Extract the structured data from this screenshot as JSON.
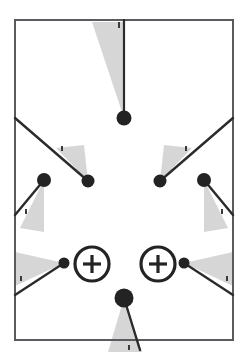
{
  "diagram": {
    "canvas": {
      "width": 248,
      "height": 355,
      "background": "#ffffff"
    },
    "colors": {
      "frame_stroke": "#5a5a5f",
      "line_stroke": "#2b2b2b",
      "node_fill": "#232323",
      "wedge_fill": "#d6d6d6",
      "tick_fill": "#3a3a3a",
      "symbol_stroke": "#232323",
      "symbol_fill": "#ffffff"
    },
    "frame": {
      "label": "border-rectangle",
      "x": 15,
      "y": 20,
      "width": 218,
      "height": 320,
      "stroke_width": 2
    },
    "nodes": [
      {
        "name": "node-top-center",
        "cx": 124,
        "cy": 118,
        "r": 7.5
      },
      {
        "name": "node-upper-left",
        "cx": 88,
        "cy": 181,
        "r": 6.5
      },
      {
        "name": "node-upper-right",
        "cx": 160,
        "cy": 181,
        "r": 6.5
      },
      {
        "name": "node-mid-left",
        "cx": 44,
        "cy": 180,
        "r": 7.0
      },
      {
        "name": "node-mid-right",
        "cx": 204,
        "cy": 180,
        "r": 7.0
      },
      {
        "name": "node-target-left",
        "cx": 64,
        "cy": 263,
        "r": 5.5
      },
      {
        "name": "node-target-right",
        "cx": 184,
        "cy": 263,
        "r": 5.5
      },
      {
        "name": "node-bottom-center",
        "cx": 124,
        "cy": 298,
        "r": 9.5
      }
    ],
    "leader_lines": [
      {
        "name": "leader-top-center",
        "x1": 124,
        "y1": 20,
        "x2": 124,
        "y2": 118,
        "width": 2.2
      },
      {
        "name": "leader-upper-left",
        "x1": 15,
        "y1": 118,
        "x2": 88,
        "y2": 181,
        "width": 2.4
      },
      {
        "name": "leader-upper-right",
        "x1": 233,
        "y1": 118,
        "x2": 160,
        "y2": 181,
        "width": 2.4
      },
      {
        "name": "leader-mid-left",
        "x1": 15,
        "y1": 215,
        "x2": 44,
        "y2": 180,
        "width": 2.4
      },
      {
        "name": "leader-mid-right",
        "x1": 233,
        "y1": 215,
        "x2": 204,
        "y2": 180,
        "width": 2.4
      },
      {
        "name": "leader-target-left",
        "x1": 15,
        "y1": 295,
        "x2": 64,
        "y2": 263,
        "width": 2.4
      },
      {
        "name": "leader-target-right",
        "x1": 233,
        "y1": 295,
        "x2": 184,
        "y2": 263,
        "width": 2.4
      },
      {
        "name": "leader-bottom-center",
        "x1": 124,
        "y1": 298,
        "x2": 140,
        "y2": 350,
        "width": 2.4
      }
    ],
    "wedges": [
      {
        "name": "wedge-top-center",
        "points": "124,118 92,22 124,22"
      },
      {
        "name": "wedge-upper-left",
        "points": "88,181 56,148 84,145"
      },
      {
        "name": "wedge-upper-right",
        "points": "160,181 192,148 164,145"
      },
      {
        "name": "wedge-mid-left",
        "points": "44,180 20,228 44,232"
      },
      {
        "name": "wedge-mid-right",
        "points": "204,180 228,228 204,232"
      },
      {
        "name": "wedge-target-left",
        "points": "64,263 15,252 15,286"
      },
      {
        "name": "wedge-target-right",
        "points": "184,263 233,252 233,286"
      },
      {
        "name": "wedge-bottom-center",
        "points": "124,298 108,352 142,352"
      }
    ],
    "tick_marks": [
      {
        "name": "tick-top",
        "x": 118,
        "y": 22,
        "w": 2,
        "h": 6
      },
      {
        "name": "tick-upper-left",
        "x": 61,
        "y": 146,
        "w": 2,
        "h": 5
      },
      {
        "name": "tick-upper-right",
        "x": 185,
        "y": 146,
        "w": 2,
        "h": 5
      },
      {
        "name": "tick-mid-left",
        "x": 25,
        "y": 209,
        "w": 2,
        "h": 5
      },
      {
        "name": "tick-mid-right",
        "x": 221,
        "y": 209,
        "w": 2,
        "h": 5
      },
      {
        "name": "tick-target-left",
        "x": 20,
        "y": 276,
        "w": 2,
        "h": 5
      },
      {
        "name": "tick-target-right",
        "x": 226,
        "y": 276,
        "w": 2,
        "h": 5
      },
      {
        "name": "tick-bottom",
        "x": 128,
        "y": 345,
        "w": 2,
        "h": 5
      }
    ],
    "target_symbols": [
      {
        "name": "target-symbol-left",
        "label": "+",
        "cx": 92,
        "cy": 264,
        "r": 17,
        "stroke_width": 3.2,
        "cross_arm": 9
      },
      {
        "name": "target-symbol-right",
        "label": "+",
        "cx": 158,
        "cy": 264,
        "r": 17,
        "stroke_width": 3.2,
        "cross_arm": 9
      }
    ]
  }
}
